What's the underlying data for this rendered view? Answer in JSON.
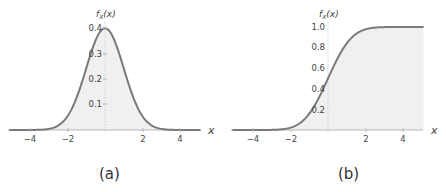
{
  "chart_data": [
    {
      "type": "area",
      "panel_label": "(a)",
      "title": "",
      "xlabel": "x",
      "ylabel": "f_X(x)",
      "xlim": [
        -5.1,
        5.1
      ],
      "ylim": [
        0,
        0.4
      ],
      "x_ticks": [
        -4,
        -2,
        2,
        4
      ],
      "y_ticks": [
        0.1,
        0.2,
        0.3,
        0.4
      ],
      "series": [
        {
          "name": "standard normal PDF",
          "function": "exp(-x^2/2)/sqrt(2*pi)",
          "x": [
            -5,
            -4,
            -3,
            -2,
            -1.5,
            -1,
            -0.5,
            0,
            0.5,
            1,
            1.5,
            2,
            3,
            4,
            5
          ],
          "y": [
            0.0,
            0.0001,
            0.0044,
            0.054,
            0.1295,
            0.242,
            0.3521,
            0.3989,
            0.3521,
            0.242,
            0.1295,
            0.054,
            0.0044,
            0.0001,
            0.0
          ]
        }
      ],
      "grid": false,
      "fill": "shaded area under curve"
    },
    {
      "type": "area",
      "panel_label": "(b)",
      "title": "",
      "xlabel": "x",
      "ylabel": "f_X(x)",
      "xlim": [
        -5.1,
        5.1
      ],
      "ylim": [
        0,
        1.0
      ],
      "x_ticks": [
        -4,
        -2,
        2,
        4
      ],
      "y_ticks": [
        0.2,
        0.4,
        0.6,
        0.8,
        1.0
      ],
      "series": [
        {
          "name": "standard normal CDF",
          "function": "Phi(x)",
          "x": [
            -5,
            -4,
            -3,
            -2,
            -1.5,
            -1,
            -0.5,
            0,
            0.5,
            1,
            1.5,
            2,
            3,
            4,
            5
          ],
          "y": [
            0.0,
            0.0,
            0.0013,
            0.0228,
            0.0668,
            0.1587,
            0.3085,
            0.5,
            0.6915,
            0.8413,
            0.9332,
            0.9772,
            0.9987,
            1.0,
            1.0
          ]
        }
      ],
      "grid": false,
      "fill": "shaded area under curve"
    }
  ],
  "panels": {
    "a": {
      "ylabel_main": "f",
      "ylabel_sub": "X",
      "ylabel_arg": "(x)",
      "xlabel": "x",
      "x_ticks": [
        "−4",
        "−2",
        "2",
        "4"
      ],
      "y_ticks": [
        "0.1",
        "0.2",
        "0.3",
        "0.4"
      ],
      "caption": "(a)"
    },
    "b": {
      "ylabel_main": "f",
      "ylabel_sub": "X",
      "ylabel_arg": "(x)",
      "xlabel": "x",
      "x_ticks": [
        "−4",
        "−2",
        "2",
        "4"
      ],
      "y_ticks": [
        "0.2",
        "0.4",
        "0.6",
        "0.8",
        "1.0"
      ],
      "caption": "(b)"
    }
  },
  "colors": {
    "curve": "#7a7a7a",
    "fill": "#f0f0f0",
    "axis": "#b8b8b8",
    "text": "#444444"
  }
}
